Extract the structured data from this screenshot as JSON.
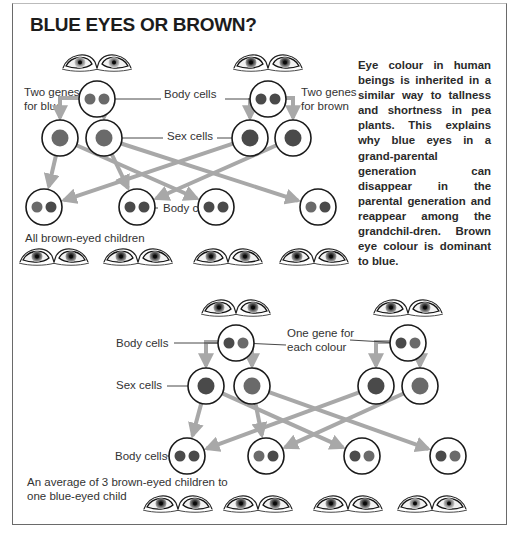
{
  "title": "BLUE EYES OR BROWN?",
  "description": "Eye colour in human beings is inherited in a similar way to tallness and shortness in pea plants. This explains why blue eyes in a grand-parental generation can disappear in the parental generation and reappear among the grandchil-dren. Brown eye colour is dominant to blue.",
  "colors": {
    "cell_outline": "#1a1a1a",
    "gene_brown": "#4a4a4a",
    "gene_blue": "#6a6a6a",
    "arrow": "#a8a8a8",
    "leader_line": "#333333"
  },
  "cross_1": {
    "labels": {
      "parent_left": [
        "Two genes",
        "for blue"
      ],
      "parent_right": [
        "Two genes",
        "for brown"
      ],
      "body_cells": "Body cells",
      "sex_cells": "Sex cells",
      "children_body_cells": "Body cells",
      "outcome": "All brown-eyed children"
    },
    "parents": [
      {
        "genes": [
          "blue",
          "blue"
        ],
        "eyes": "blue"
      },
      {
        "genes": [
          "brown",
          "brown"
        ],
        "eyes": "brown"
      }
    ],
    "sex_cells": [
      {
        "parent": 0,
        "gene": "blue"
      },
      {
        "parent": 0,
        "gene": "blue"
      },
      {
        "parent": 1,
        "gene": "brown"
      },
      {
        "parent": 1,
        "gene": "brown"
      }
    ],
    "children": [
      {
        "genes": [
          "blue",
          "brown"
        ],
        "eyes": "brown"
      },
      {
        "genes": [
          "brown",
          "brown"
        ],
        "eyes": "brown"
      },
      {
        "genes": [
          "brown",
          "brown"
        ],
        "eyes": "brown"
      },
      {
        "genes": [
          "blue",
          "brown"
        ],
        "eyes": "brown"
      }
    ]
  },
  "cross_2": {
    "labels": {
      "body_cells": "Body cells",
      "one_gene": [
        "One gene for",
        "each colour"
      ],
      "sex_cells": "Sex cells",
      "children_body_cells": "Body cells",
      "outcome": [
        "An average of 3 brown-eyed children to",
        "one blue-eyed child"
      ]
    },
    "parents": [
      {
        "genes": [
          "brown",
          "blue"
        ],
        "eyes": "brown"
      },
      {
        "genes": [
          "brown",
          "blue"
        ],
        "eyes": "brown"
      }
    ],
    "sex_cells": [
      {
        "parent": 0,
        "gene": "brown"
      },
      {
        "parent": 0,
        "gene": "blue"
      },
      {
        "parent": 1,
        "gene": "brown"
      },
      {
        "parent": 1,
        "gene": "blue"
      }
    ],
    "children": [
      {
        "genes": [
          "brown",
          "brown"
        ],
        "eyes": "brown"
      },
      {
        "genes": [
          "blue",
          "brown"
        ],
        "eyes": "brown"
      },
      {
        "genes": [
          "brown",
          "blue"
        ],
        "eyes": "brown"
      },
      {
        "genes": [
          "brown",
          "blue"
        ],
        "eyes": "blue"
      }
    ]
  }
}
